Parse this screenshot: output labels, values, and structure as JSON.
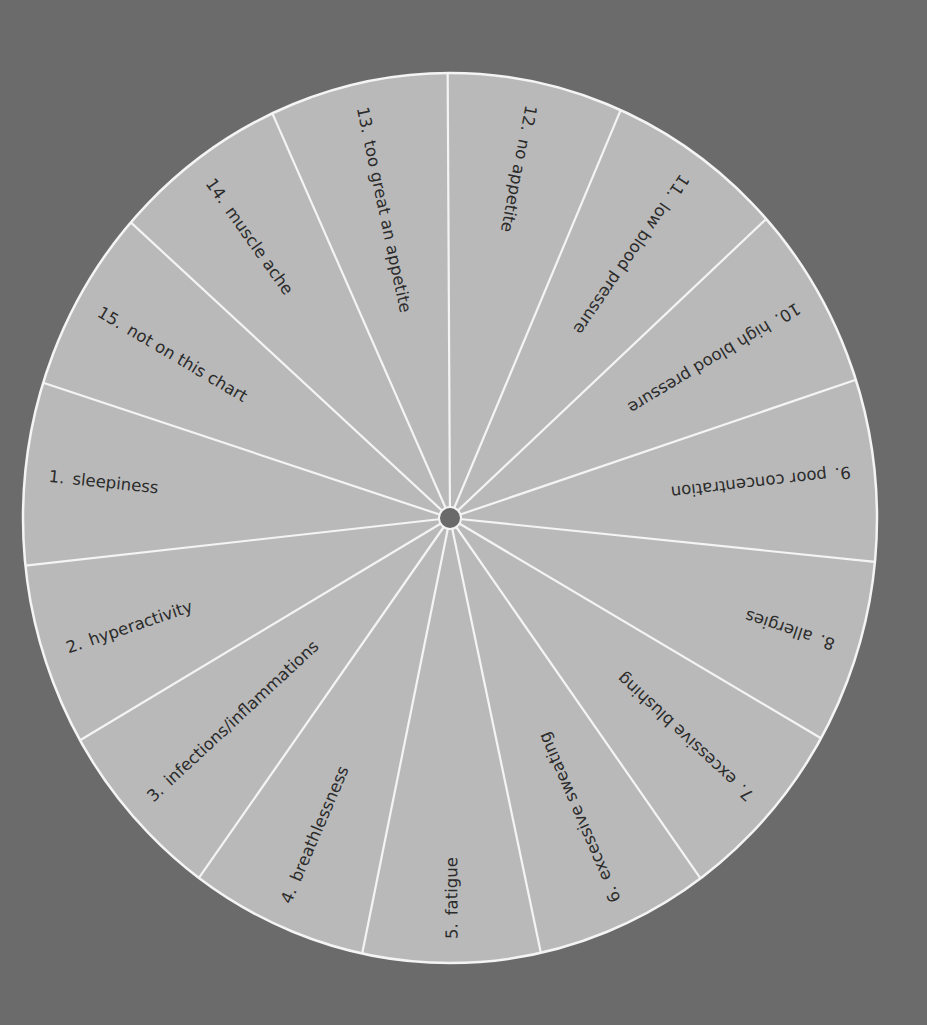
{
  "wheel": {
    "center": [
      450,
      518
    ],
    "radius_x": 427,
    "radius_y": 445,
    "hub_radius": 11,
    "label_inset": 24,
    "colors": {
      "background": "#6b6b6b",
      "face": "#b9b9b9",
      "lines": "#f4f4f4",
      "hub": "#6a6a6a",
      "text": "#2b2b2b"
    },
    "spoke_angles_deg": [
      -90.3,
      -67.3,
      -43.4,
      -18.8,
      5.9,
      30.7,
      55.2,
      78.2,
      101.4,
      124.9,
      149.0,
      173.6,
      198.4,
      222.8,
      246.3
    ],
    "sectors": [
      {
        "number": "12.",
        "label": "no appetite",
        "mid_angle": -78.8
      },
      {
        "number": "11.",
        "label": "low blood pressure",
        "mid_angle": -55.4
      },
      {
        "number": "10.",
        "label": "high blood pressure",
        "mid_angle": -31.1
      },
      {
        "number": "9.",
        "label": "poor concentration",
        "mid_angle": -6.5
      },
      {
        "number": "8.",
        "label": "allergies",
        "mid_angle": 18.3
      },
      {
        "number": "7.",
        "label": "excessive blushing",
        "mid_angle": 43.0
      },
      {
        "number": "6.",
        "label": "excessive sweating",
        "mid_angle": 66.7
      },
      {
        "number": "5.",
        "label": "fatigue",
        "mid_angle": 89.8
      },
      {
        "number": "4.",
        "label": "breathlessness",
        "mid_angle": 113.2
      },
      {
        "number": "3.",
        "label": "infections/inflammations",
        "mid_angle": 137.0
      },
      {
        "number": "2.",
        "label": "hyperactivity",
        "mid_angle": 161.3
      },
      {
        "number": "1.",
        "label": "sleepiness",
        "mid_angle": 186.0
      },
      {
        "number": "15.",
        "label": "not on this chart",
        "mid_angle": 210.6
      },
      {
        "number": "14.",
        "label": "muscle ache",
        "mid_angle": 234.6
      },
      {
        "number": "13.",
        "label": "too great an appetite",
        "mid_angle": 258.0
      }
    ]
  }
}
